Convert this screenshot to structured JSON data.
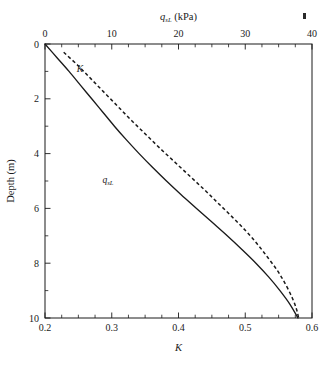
{
  "figure": {
    "background": "#ffffff",
    "ink_color": "#1a1a1a"
  },
  "chart_data": {
    "type": "line",
    "title": "",
    "xlabel": "K",
    "ylabel": "Depth (m)",
    "top_axis_label": "q_sL (kPa)",
    "top_axis_label_main": "q",
    "top_axis_label_sub": "sL",
    "top_axis_label_unit": " (kPa)",
    "grid": false,
    "legend_position": "inline-annotations",
    "axes": {
      "bottom": {
        "name": "K",
        "label": "K",
        "lim": [
          0.2,
          0.6
        ],
        "ticks": [
          0.2,
          0.3,
          0.4,
          0.5,
          0.6
        ],
        "tick_labels": [
          "0.2",
          "0.3",
          "0.4",
          "0.5",
          "0.6"
        ],
        "minor_tick_step": 0.025,
        "tick_direction": "in"
      },
      "top": {
        "name": "q_sL",
        "label": "q_sL (kPa)",
        "lim": [
          0,
          40
        ],
        "ticks": [
          0,
          10,
          20,
          30,
          40
        ],
        "tick_labels": [
          "0",
          "10",
          "20",
          "30",
          "40"
        ],
        "minor_tick_step": 2.5,
        "tick_direction": "in"
      },
      "left": {
        "name": "Depth",
        "label": "Depth (m)",
        "lim": [
          0,
          10
        ],
        "invert": true,
        "ticks": [
          0,
          2,
          4,
          6,
          8,
          10
        ],
        "tick_labels": [
          "0",
          "2",
          "4",
          "6",
          "8",
          "10"
        ],
        "minor_tick_step": 0.5,
        "tick_direction": "in"
      }
    },
    "series": [
      {
        "name": "q_sL",
        "label_main": "q",
        "label_sub": "sL",
        "style": "solid",
        "axis": "top",
        "x_unit": "kPa",
        "annotation_position": {
          "x_px": 108,
          "y_px": 180
        },
        "points": [
          {
            "depth": 0.0,
            "q_sL": 0.0
          },
          {
            "depth": 0.5,
            "q_sL": 1.8
          },
          {
            "depth": 1.0,
            "q_sL": 3.6
          },
          {
            "depth": 1.5,
            "q_sL": 5.3
          },
          {
            "depth": 2.0,
            "q_sL": 7.0
          },
          {
            "depth": 2.5,
            "q_sL": 8.7
          },
          {
            "depth": 3.0,
            "q_sL": 10.4
          },
          {
            "depth": 3.5,
            "q_sL": 12.2
          },
          {
            "depth": 4.0,
            "q_sL": 14.1
          },
          {
            "depth": 4.5,
            "q_sL": 16.1
          },
          {
            "depth": 5.0,
            "q_sL": 18.2
          },
          {
            "depth": 5.5,
            "q_sL": 20.4
          },
          {
            "depth": 6.0,
            "q_sL": 22.7
          },
          {
            "depth": 6.5,
            "q_sL": 25.0
          },
          {
            "depth": 7.0,
            "q_sL": 27.3
          },
          {
            "depth": 7.5,
            "q_sL": 29.5
          },
          {
            "depth": 8.0,
            "q_sL": 31.6
          },
          {
            "depth": 8.5,
            "q_sL": 33.5
          },
          {
            "depth": 9.0,
            "q_sL": 35.2
          },
          {
            "depth": 9.5,
            "q_sL": 36.7
          },
          {
            "depth": 10.0,
            "q_sL": 37.9
          }
        ]
      },
      {
        "name": "K",
        "label_main": "K",
        "label_sub": "",
        "style": "dashed",
        "axis": "bottom",
        "annotation_position": {
          "x_px": 80,
          "y_px": 69
        },
        "points": [
          {
            "depth": 0.3,
            "K": 0.228
          },
          {
            "depth": 0.8,
            "K": 0.25
          },
          {
            "depth": 1.3,
            "K": 0.27
          },
          {
            "depth": 1.8,
            "K": 0.29
          },
          {
            "depth": 2.3,
            "K": 0.31
          },
          {
            "depth": 2.8,
            "K": 0.33
          },
          {
            "depth": 3.3,
            "K": 0.351
          },
          {
            "depth": 3.8,
            "K": 0.372
          },
          {
            "depth": 4.3,
            "K": 0.394
          },
          {
            "depth": 4.8,
            "K": 0.416
          },
          {
            "depth": 5.3,
            "K": 0.438
          },
          {
            "depth": 5.8,
            "K": 0.459
          },
          {
            "depth": 6.3,
            "K": 0.48
          },
          {
            "depth": 6.8,
            "K": 0.5
          },
          {
            "depth": 7.3,
            "K": 0.518
          },
          {
            "depth": 7.8,
            "K": 0.534
          },
          {
            "depth": 8.3,
            "K": 0.549
          },
          {
            "depth": 8.8,
            "K": 0.561
          },
          {
            "depth": 9.3,
            "K": 0.571
          },
          {
            "depth": 9.7,
            "K": 0.577
          },
          {
            "depth": 10.0,
            "K": 0.58
          }
        ]
      }
    ],
    "annotations": [
      {
        "name": "speck",
        "x_px": 303,
        "y_px": 15,
        "w_px": 3,
        "h_px": 6
      }
    ]
  }
}
